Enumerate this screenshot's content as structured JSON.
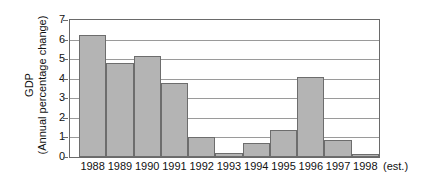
{
  "chart_data": {
    "type": "bar",
    "title": "",
    "subtitle": "",
    "xlabel": "",
    "ylabel": "GDP",
    "ylabel_sub": "(Annual percentage change)",
    "categories": [
      "1988",
      "1989",
      "1990",
      "1991",
      "1992",
      "1993",
      "1994",
      "1995",
      "1996",
      "1997",
      "1998"
    ],
    "values": [
      6.25,
      4.8,
      5.15,
      3.8,
      1.0,
      0.2,
      0.7,
      1.4,
      4.1,
      0.85,
      0.15
    ],
    "ylim": [
      0,
      7
    ],
    "yticks": [
      "0",
      "1",
      "2",
      "3",
      "4",
      "5",
      "6",
      "7"
    ],
    "ytick_values": [
      0,
      1,
      2,
      3,
      4,
      5,
      6,
      7
    ],
    "grid": true,
    "grid_axis": "y",
    "legend": null,
    "legend_position": "none",
    "annotation": "(est.)",
    "annotation_applies_to": "1998",
    "bar_color": "#b4b4b4",
    "bar_edge_color": "#6d6d6d",
    "axis_color": "#6a6a6a",
    "grid_color": "#9a9a9a",
    "background_color": "#ffffff",
    "text_color": "#111111"
  }
}
